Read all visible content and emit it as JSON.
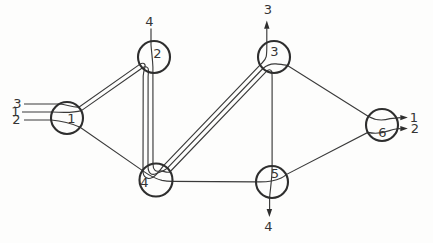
{
  "figure": {
    "type": "network-flow-routing-diagram",
    "colors": {
      "background": "#fdfdfc",
      "ink": "#2e2e2e"
    },
    "nodes": [
      {
        "label": "1"
      },
      {
        "label": "2"
      },
      {
        "label": "3"
      },
      {
        "label": "4"
      },
      {
        "label": "5"
      },
      {
        "label": "6"
      }
    ],
    "inputs": {
      "node1": [
        {
          "label": "3"
        },
        {
          "label": "1"
        },
        {
          "label": "2"
        }
      ],
      "node2": [
        {
          "label": "4"
        }
      ]
    },
    "outputs": {
      "node3": [
        {
          "label": "3"
        }
      ],
      "node5": [
        {
          "label": "4"
        }
      ],
      "node6": [
        {
          "label": "1"
        },
        {
          "label": "2"
        }
      ]
    },
    "links": [
      {
        "from": "1",
        "to": "2",
        "lines": 2
      },
      {
        "from": "1",
        "to": "4",
        "lines": 1
      },
      {
        "from": "2",
        "to": "4",
        "lines": 3
      },
      {
        "from": "4",
        "to": "3",
        "lines": 3
      },
      {
        "from": "4",
        "to": "5",
        "lines": 1
      },
      {
        "from": "3",
        "to": "5",
        "lines": 1
      },
      {
        "from": "3",
        "to": "6",
        "lines": 1
      },
      {
        "from": "5",
        "to": "6",
        "lines": 1
      }
    ],
    "flows": [
      {
        "label": "1",
        "route": "in@1 -> 2 -> 4 -> 3 -> 6 out"
      },
      {
        "label": "2",
        "route": "in@1 -> 4 -> 5 -> 6 out"
      },
      {
        "label": "3",
        "route": "in@1 -> 2 -> 4 -> 3 out"
      },
      {
        "label": "4",
        "route": "in@2 -> 4 -> 3 -> 5 out"
      }
    ]
  }
}
